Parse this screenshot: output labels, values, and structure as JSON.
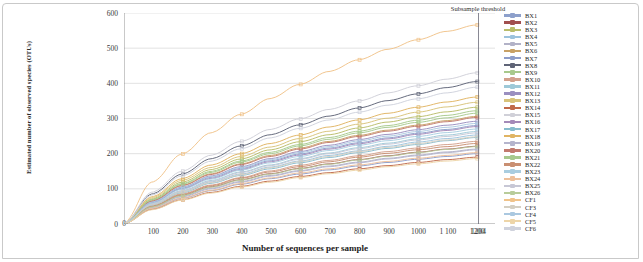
{
  "chart_data": {
    "type": "line",
    "title": "",
    "xlabel": "Number of sequences per sample",
    "ylabel": "Estimated number of observed species (OTUs)",
    "xlim": [
      0,
      1260
    ],
    "ylim": [
      0,
      600
    ],
    "ytick_values": [
      0,
      100,
      200,
      300,
      400,
      500,
      600
    ],
    "ytick_labels": [
      "0",
      "100",
      "200",
      "300",
      "400",
      "500",
      "600"
    ],
    "xtick_values": [
      0,
      100,
      200,
      300,
      400,
      500,
      600,
      700,
      800,
      900,
      1000,
      1100,
      1200,
      1204
    ],
    "xtick_labels": [
      "0",
      "100",
      "200",
      "300",
      "400",
      "500",
      "600",
      "700",
      "800",
      "900",
      "1000",
      "1 100",
      "1200",
      "1204"
    ],
    "grid": "horizontal",
    "legend_position": "right",
    "markers": true,
    "x": [
      0,
      100,
      200,
      300,
      400,
      500,
      600,
      700,
      800,
      900,
      1000,
      1100,
      1200,
      1204
    ],
    "annotations": [
      {
        "name": "subsample-threshold",
        "label": "Subsample threshold",
        "x": 1204,
        "type": "vline",
        "color": "#6b6b78"
      }
    ],
    "series": [
      {
        "name": "BX1",
        "color": "#8da0cb",
        "values": [
          0,
          62,
          102,
          133,
          158,
          180,
          199,
          216,
          231,
          245,
          258,
          269,
          280,
          281
        ]
      },
      {
        "name": "BX2",
        "color": "#a14f4f",
        "values": [
          0,
          50,
          82,
          106,
          126,
          143,
          158,
          171,
          183,
          194,
          204,
          213,
          221,
          222
        ]
      },
      {
        "name": "BX3",
        "color": "#b9bd6a",
        "values": [
          0,
          72,
          119,
          155,
          185,
          211,
          234,
          254,
          273,
          290,
          305,
          319,
          332,
          333
        ]
      },
      {
        "name": "BX4",
        "color": "#9cc3dd",
        "values": [
          0,
          56,
          92,
          120,
          142,
          162,
          179,
          195,
          208,
          221,
          233,
          243,
          253,
          254
        ]
      },
      {
        "name": "BX5",
        "color": "#b2b2c7",
        "values": [
          0,
          48,
          79,
          102,
          121,
          138,
          152,
          165,
          176,
          187,
          196,
          205,
          213,
          214
        ]
      },
      {
        "name": "BX6",
        "color": "#c8a165",
        "values": [
          0,
          67,
          110,
          143,
          171,
          195,
          216,
          235,
          252,
          267,
          281,
          294,
          306,
          307
        ]
      },
      {
        "name": "BX7",
        "color": "#8d9dc9",
        "values": [
          0,
          44,
          73,
          95,
          113,
          129,
          142,
          154,
          165,
          175,
          184,
          192,
          200,
          201
        ]
      },
      {
        "name": "BX8",
        "color": "#5f6477",
        "values": [
          0,
          86,
          142,
          186,
          222,
          254,
          282,
          307,
          330,
          351,
          370,
          388,
          405,
          407
        ]
      },
      {
        "name": "BX9",
        "color": "#a8c98c",
        "values": [
          0,
          70,
          115,
          150,
          179,
          204,
          226,
          246,
          264,
          280,
          295,
          309,
          322,
          323
        ]
      },
      {
        "name": "BX10",
        "color": "#d3a08c",
        "values": [
          0,
          52,
          86,
          111,
          132,
          151,
          167,
          181,
          194,
          206,
          216,
          226,
          235,
          236
        ]
      },
      {
        "name": "BX11",
        "color": "#9ec9d8",
        "values": [
          0,
          58,
          95,
          124,
          148,
          168,
          186,
          202,
          217,
          230,
          242,
          253,
          263,
          264
        ]
      },
      {
        "name": "BX12",
        "color": "#9a8fc0",
        "values": [
          0,
          64,
          105,
          137,
          163,
          186,
          206,
          224,
          240,
          255,
          268,
          281,
          292,
          293
        ]
      },
      {
        "name": "BX13",
        "color": "#d8c37a",
        "values": [
          0,
          75,
          124,
          161,
          192,
          219,
          243,
          264,
          284,
          301,
          318,
          333,
          346,
          348
        ]
      },
      {
        "name": "BX14",
        "color": "#c0694a",
        "values": [
          0,
          42,
          69,
          90,
          107,
          122,
          135,
          146,
          157,
          166,
          175,
          183,
          190,
          191
        ]
      },
      {
        "name": "BX15",
        "color": "#d0d0d8",
        "values": [
          0,
          91,
          150,
          196,
          235,
          269,
          299,
          326,
          350,
          373,
          393,
          412,
          430,
          432
        ]
      },
      {
        "name": "BX16",
        "color": "#a48ab8",
        "values": [
          0,
          61,
          100,
          130,
          155,
          177,
          196,
          213,
          228,
          242,
          255,
          266,
          277,
          278
        ]
      },
      {
        "name": "BX17",
        "color": "#87bccd",
        "values": [
          0,
          54,
          89,
          116,
          138,
          157,
          174,
          189,
          203,
          215,
          226,
          237,
          246,
          247
        ]
      },
      {
        "name": "BX18",
        "color": "#e0b463",
        "values": [
          0,
          78,
          129,
          168,
          200,
          229,
          253,
          276,
          296,
          315,
          332,
          347,
          361,
          363
        ]
      },
      {
        "name": "BX19",
        "color": "#b5b5cd",
        "values": [
          0,
          47,
          77,
          100,
          119,
          136,
          150,
          163,
          174,
          185,
          194,
          203,
          211,
          212
        ]
      },
      {
        "name": "BX20",
        "color": "#c27a6e",
        "values": [
          0,
          66,
          109,
          141,
          169,
          192,
          213,
          232,
          249,
          264,
          278,
          291,
          303,
          304
        ]
      },
      {
        "name": "BX21",
        "color": "#a7c98e",
        "values": [
          0,
          69,
          113,
          147,
          176,
          200,
          222,
          241,
          259,
          275,
          289,
          302,
          315,
          316
        ]
      },
      {
        "name": "BX22",
        "color": "#c98f72",
        "values": [
          0,
          51,
          84,
          109,
          130,
          148,
          163,
          177,
          190,
          201,
          211,
          220,
          229,
          230
        ]
      },
      {
        "name": "BX23",
        "color": "#a9cde0",
        "values": [
          0,
          60,
          99,
          128,
          153,
          174,
          192,
          209,
          224,
          237,
          249,
          260,
          270,
          271
        ]
      },
      {
        "name": "BX24",
        "color": "#edc09b",
        "values": [
          0,
          45,
          74,
          96,
          115,
          131,
          145,
          157,
          168,
          178,
          187,
          195,
          203,
          204
        ]
      },
      {
        "name": "BX25",
        "color": "#c7c7d5",
        "values": [
          0,
          57,
          94,
          122,
          146,
          166,
          184,
          200,
          214,
          227,
          239,
          249,
          259,
          260
        ]
      },
      {
        "name": "BX26",
        "color": "#b8cc9a",
        "values": [
          0,
          49,
          81,
          105,
          125,
          142,
          157,
          170,
          182,
          193,
          203,
          212,
          220,
          221
        ]
      },
      {
        "name": "CF1",
        "color": "#f0c38a",
        "values": [
          0,
          120,
          199,
          260,
          312,
          357,
          397,
          434,
          467,
          497,
          524,
          548,
          566,
          566
        ]
      },
      {
        "name": "CF3",
        "color": "#d4cfc2",
        "values": [
          0,
          55,
          91,
          118,
          140,
          160,
          177,
          192,
          206,
          218,
          229,
          239,
          248,
          249
        ]
      },
      {
        "name": "CF4",
        "color": "#aac8e0",
        "values": [
          0,
          63,
          104,
          135,
          161,
          183,
          203,
          220,
          236,
          250,
          263,
          275,
          286,
          287
        ]
      },
      {
        "name": "CF5",
        "color": "#edd5a8",
        "values": [
          0,
          41,
          68,
          88,
          105,
          119,
          132,
          143,
          153,
          163,
          171,
          179,
          186,
          187
        ]
      },
      {
        "name": "CF6",
        "color": "#cfd2dc",
        "values": [
          0,
          83,
          137,
          179,
          214,
          245,
          272,
          296,
          318,
          338,
          356,
          373,
          389,
          391
        ]
      }
    ]
  }
}
